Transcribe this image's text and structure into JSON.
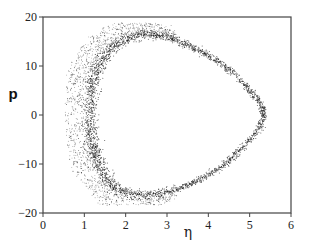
{
  "chart_data": {
    "type": "scatter",
    "title": "",
    "xlabel": "η",
    "ylabel": "p",
    "xlim": [
      0,
      6
    ],
    "ylim": [
      -20,
      20
    ],
    "xticks": [
      0,
      1,
      2,
      3,
      4,
      5,
      6
    ],
    "yticks": [
      -20,
      -10,
      0,
      10,
      20
    ],
    "xtick_labels": [
      "0",
      "1",
      "2",
      "3",
      "4",
      "5",
      "6"
    ],
    "ytick_labels": [
      "−20",
      "−10",
      "0",
      "10",
      "20"
    ],
    "grid": false,
    "legend": null,
    "series": [
      {
        "name": "dense orbit (inner curve)",
        "description": "Closed loop trajectory in (η, p) phase space",
        "points": [
          {
            "eta": 1.15,
            "p": 0
          },
          {
            "eta": 1.2,
            "p": 6
          },
          {
            "eta": 1.35,
            "p": 10
          },
          {
            "eta": 1.7,
            "p": 13.8
          },
          {
            "eta": 2.3,
            "p": 16.2
          },
          {
            "eta": 3.0,
            "p": 15.8
          },
          {
            "eta": 3.7,
            "p": 13.5
          },
          {
            "eta": 4.4,
            "p": 10
          },
          {
            "eta": 5.0,
            "p": 5
          },
          {
            "eta": 5.35,
            "p": 0
          },
          {
            "eta": 5.0,
            "p": -5
          },
          {
            "eta": 4.4,
            "p": -10
          },
          {
            "eta": 3.7,
            "p": -13.5
          },
          {
            "eta": 3.0,
            "p": -15.6
          },
          {
            "eta": 2.3,
            "p": -16.2
          },
          {
            "eta": 1.7,
            "p": -14.5
          },
          {
            "eta": 1.35,
            "p": -10
          },
          {
            "eta": 1.2,
            "p": -6
          }
        ]
      },
      {
        "name": "diffuse scatter band (outer)",
        "description": "Broad cloud of points outside the orbit on the low-η side",
        "extent": {
          "eta_min": 0.53,
          "eta_max": 3.2,
          "p_min": -18.4,
          "p_max": 18.8
        },
        "max_outward_spread_eta": 0.65
      }
    ]
  }
}
